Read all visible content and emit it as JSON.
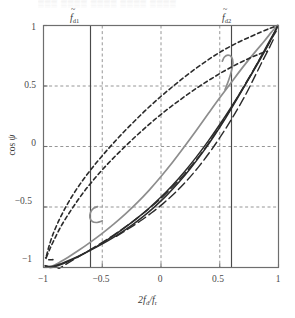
{
  "figure": {
    "kind": "line-plot",
    "top_artifact_text": "▒▒▒ ▒▒▒▒ ▒▒▒▒ ▒▒▒▒ ▒▒▒▒"
  },
  "axes": {
    "x_title_prefix": "2",
    "x_title_num": "f",
    "x_title_num_sub": "d",
    "x_title_slash": "/",
    "x_title_den": "f",
    "x_title_den_sub": "r",
    "y_title_fn": "cos",
    "y_title_var": "ψ",
    "x_ticks": [
      "−1",
      "−0.5",
      "0",
      "0.5",
      "1"
    ],
    "x_tick_values": [
      -1,
      -0.5,
      0,
      0.5,
      1
    ],
    "y_ticks": [
      "1",
      "0.5",
      "0",
      "−0.5",
      "−1"
    ],
    "y_tick_values": [
      1,
      0.5,
      0,
      -0.5,
      -1
    ],
    "xlim": [
      -1,
      1
    ],
    "ylim": [
      -1,
      1
    ],
    "grid": "dashed-gray"
  },
  "markers": [
    {
      "name": "fd1",
      "symbol": "f",
      "sub": "d1",
      "x": -0.6,
      "style": "solid-vertical"
    },
    {
      "name": "fd2",
      "symbol": "f",
      "sub": "d2",
      "x": 0.6,
      "style": "solid-vertical"
    }
  ],
  "colors": {
    "frame": "#6e6e6e",
    "grid": "#8a8a8a",
    "gray_curve": "#8d8d8d",
    "black_curve": "#2b2b2b",
    "text": "#3a3a3a",
    "background": "#ffffff"
  },
  "chart_data": {
    "type": "line",
    "title": "",
    "xlabel": "2 f_d / f_r",
    "ylabel": "cos psi",
    "xlim": [
      -1,
      1
    ],
    "ylim": [
      -1,
      1
    ],
    "grid": true,
    "legend": "none",
    "annotations": [
      {
        "text": "f̃_d1",
        "x": -0.6,
        "y": 1.12
      },
      {
        "text": "f̃_d2",
        "x": 0.6,
        "y": 1.12
      }
    ],
    "series": [
      {
        "name": "gray-solid-upper",
        "color": "#8d8d8d",
        "dash": "solid",
        "width": 1.7,
        "points": [
          [
            -0.985,
            -0.985
          ],
          [
            -0.96,
            -0.995
          ],
          [
            -0.92,
            -0.985
          ],
          [
            -0.86,
            -0.955
          ],
          [
            -0.79,
            -0.915
          ],
          [
            -0.7,
            -0.858
          ],
          [
            -0.6,
            -0.79
          ],
          [
            -0.5,
            -0.718
          ],
          [
            -0.4,
            -0.64
          ],
          [
            -0.3,
            -0.555
          ],
          [
            -0.2,
            -0.462
          ],
          [
            -0.1,
            -0.36
          ],
          [
            0.0,
            -0.248
          ],
          [
            0.1,
            -0.128
          ],
          [
            0.2,
            0.0
          ],
          [
            0.3,
            0.132
          ],
          [
            0.4,
            0.268
          ],
          [
            0.5,
            0.402
          ],
          [
            0.6,
            0.532
          ],
          [
            0.7,
            0.66
          ],
          [
            0.8,
            0.78
          ],
          [
            0.88,
            0.872
          ],
          [
            0.94,
            0.945
          ],
          [
            0.975,
            0.985
          ],
          [
            0.995,
            1.0
          ]
        ]
      },
      {
        "name": "gray-solid-hook",
        "color": "#8d8d8d",
        "dash": "solid",
        "width": 1.7,
        "points": [
          [
            -0.5,
            -0.615
          ],
          [
            -0.545,
            -0.628
          ],
          [
            -0.585,
            -0.62
          ],
          [
            -0.605,
            -0.588
          ],
          [
            -0.6,
            -0.545
          ],
          [
            -0.575,
            -0.512
          ],
          [
            -0.54,
            -0.497
          ]
        ]
      },
      {
        "name": "gray-solid-hook-right",
        "color": "#8d8d8d",
        "dash": "solid",
        "width": 1.7,
        "points": [
          [
            0.545,
            0.47
          ],
          [
            0.575,
            0.545
          ],
          [
            0.6,
            0.625
          ],
          [
            0.612,
            0.695
          ],
          [
            0.6,
            0.74
          ],
          [
            0.57,
            0.755
          ],
          [
            0.54,
            0.74
          ],
          [
            0.522,
            0.705
          ]
        ]
      },
      {
        "name": "black-solid-lower",
        "color": "#2b2b2b",
        "dash": "solid",
        "width": 1.5,
        "points": [
          [
            -0.985,
            -0.99
          ],
          [
            -0.94,
            -1.0
          ],
          [
            -0.88,
            -0.985
          ],
          [
            -0.8,
            -0.955
          ],
          [
            -0.7,
            -0.908
          ],
          [
            -0.6,
            -0.855
          ],
          [
            -0.5,
            -0.798
          ],
          [
            -0.4,
            -0.735
          ],
          [
            -0.3,
            -0.665
          ],
          [
            -0.2,
            -0.59
          ],
          [
            -0.1,
            -0.508
          ],
          [
            0.0,
            -0.418
          ],
          [
            0.1,
            -0.318
          ],
          [
            0.2,
            -0.208
          ],
          [
            0.3,
            -0.088
          ],
          [
            0.4,
            0.042
          ],
          [
            0.5,
            0.182
          ],
          [
            0.6,
            0.33
          ],
          [
            0.7,
            0.485
          ],
          [
            0.8,
            0.645
          ],
          [
            0.88,
            0.782
          ],
          [
            0.94,
            0.892
          ],
          [
            0.975,
            0.962
          ],
          [
            0.995,
            1.0
          ]
        ]
      },
      {
        "name": "black-solid-upper",
        "color": "#2b2b2b",
        "dash": "solid",
        "width": 1.5,
        "points": [
          [
            -0.985,
            -0.985
          ],
          [
            -0.93,
            -0.992
          ],
          [
            -0.85,
            -0.968
          ],
          [
            -0.75,
            -0.928
          ],
          [
            -0.65,
            -0.882
          ],
          [
            -0.55,
            -0.832
          ],
          [
            -0.45,
            -0.778
          ],
          [
            -0.35,
            -0.718
          ],
          [
            -0.25,
            -0.652
          ],
          [
            -0.15,
            -0.578
          ],
          [
            -0.05,
            -0.495
          ],
          [
            0.05,
            -0.402
          ],
          [
            0.15,
            -0.298
          ],
          [
            0.25,
            -0.182
          ],
          [
            0.35,
            -0.055
          ],
          [
            0.45,
            0.085
          ],
          [
            0.55,
            0.235
          ],
          [
            0.65,
            0.398
          ],
          [
            0.75,
            0.565
          ],
          [
            0.84,
            0.722
          ],
          [
            0.91,
            0.848
          ],
          [
            0.96,
            0.935
          ],
          [
            0.99,
            0.985
          ]
        ]
      },
      {
        "name": "short-dash-upper",
        "color": "#2b2b2b",
        "dash": "4,3",
        "width": 1.6,
        "points": [
          [
            -0.975,
            -0.905
          ],
          [
            -0.955,
            -0.83
          ],
          [
            -0.925,
            -0.74
          ],
          [
            -0.885,
            -0.645
          ],
          [
            -0.835,
            -0.545
          ],
          [
            -0.78,
            -0.448
          ],
          [
            -0.715,
            -0.348
          ],
          [
            -0.645,
            -0.252
          ],
          [
            -0.57,
            -0.158
          ],
          [
            -0.49,
            -0.065
          ],
          [
            -0.405,
            0.028
          ],
          [
            -0.315,
            0.122
          ],
          [
            -0.22,
            0.215
          ],
          [
            -0.12,
            0.31
          ],
          [
            -0.015,
            0.402
          ],
          [
            0.095,
            0.492
          ],
          [
            0.205,
            0.578
          ],
          [
            0.315,
            0.658
          ],
          [
            0.425,
            0.732
          ],
          [
            0.535,
            0.798
          ],
          [
            0.645,
            0.855
          ],
          [
            0.755,
            0.905
          ],
          [
            0.855,
            0.948
          ],
          [
            0.935,
            0.98
          ],
          [
            0.99,
            1.0
          ]
        ]
      },
      {
        "name": "short-dash-lower",
        "color": "#2b2b2b",
        "dash": "4,3",
        "width": 1.6,
        "points": [
          [
            -0.975,
            -0.915
          ],
          [
            -0.945,
            -0.845
          ],
          [
            -0.905,
            -0.762
          ],
          [
            -0.858,
            -0.672
          ],
          [
            -0.8,
            -0.578
          ],
          [
            -0.735,
            -0.482
          ],
          [
            -0.665,
            -0.386
          ],
          [
            -0.588,
            -0.292
          ],
          [
            -0.505,
            -0.198
          ],
          [
            -0.418,
            -0.108
          ],
          [
            -0.325,
            -0.018
          ],
          [
            -0.228,
            0.072
          ],
          [
            -0.128,
            0.16
          ],
          [
            -0.022,
            0.248
          ],
          [
            0.088,
            0.332
          ],
          [
            0.2,
            0.412
          ],
          [
            0.312,
            0.488
          ],
          [
            0.425,
            0.558
          ],
          [
            0.535,
            0.622
          ],
          [
            0.645,
            0.68
          ],
          [
            0.748,
            0.728
          ],
          [
            0.838,
            0.765
          ],
          [
            0.905,
            0.788
          ]
        ]
      },
      {
        "name": "short-dash-hook",
        "color": "#2b2b2b",
        "dash": "4,3",
        "width": 1.6,
        "points": [
          [
            -0.92,
            -0.935
          ],
          [
            -0.962,
            -0.935
          ],
          [
            -0.982,
            -0.92
          ]
        ]
      },
      {
        "name": "long-dash-lower",
        "color": "#2b2b2b",
        "dash": "9,4",
        "width": 1.4,
        "points": [
          [
            -0.905,
            -1.03
          ],
          [
            -0.8,
            -0.968
          ],
          [
            -0.7,
            -0.91
          ],
          [
            -0.6,
            -0.852
          ],
          [
            -0.5,
            -0.792
          ],
          [
            -0.4,
            -0.73
          ],
          [
            -0.3,
            -0.662
          ],
          [
            -0.2,
            -0.59
          ],
          [
            -0.1,
            -0.512
          ],
          [
            0.0,
            -0.428
          ],
          [
            0.1,
            -0.332
          ],
          [
            0.2,
            -0.228
          ],
          [
            0.3,
            -0.11
          ],
          [
            0.4,
            0.02
          ],
          [
            0.5,
            0.165
          ],
          [
            0.6,
            0.322
          ],
          [
            0.7,
            0.488
          ],
          [
            0.8,
            0.655
          ],
          [
            0.88,
            0.79
          ],
          [
            0.94,
            0.888
          ],
          [
            0.98,
            0.952
          ]
        ]
      },
      {
        "name": "long-dash-upper",
        "color": "#2b2b2b",
        "dash": "9,4",
        "width": 1.4,
        "points": [
          [
            -0.38,
            -0.742
          ],
          [
            -0.28,
            -0.682
          ],
          [
            -0.18,
            -0.618
          ],
          [
            -0.08,
            -0.548
          ],
          [
            0.02,
            -0.47
          ],
          [
            0.12,
            -0.382
          ],
          [
            0.22,
            -0.282
          ],
          [
            0.32,
            -0.168
          ],
          [
            0.42,
            -0.04
          ],
          [
            0.52,
            0.102
          ],
          [
            0.62,
            0.258
          ],
          [
            0.72,
            0.428
          ],
          [
            0.8,
            0.582
          ],
          [
            0.87,
            0.718
          ],
          [
            0.92,
            0.812
          ],
          [
            0.955,
            0.882
          ]
        ]
      }
    ]
  }
}
